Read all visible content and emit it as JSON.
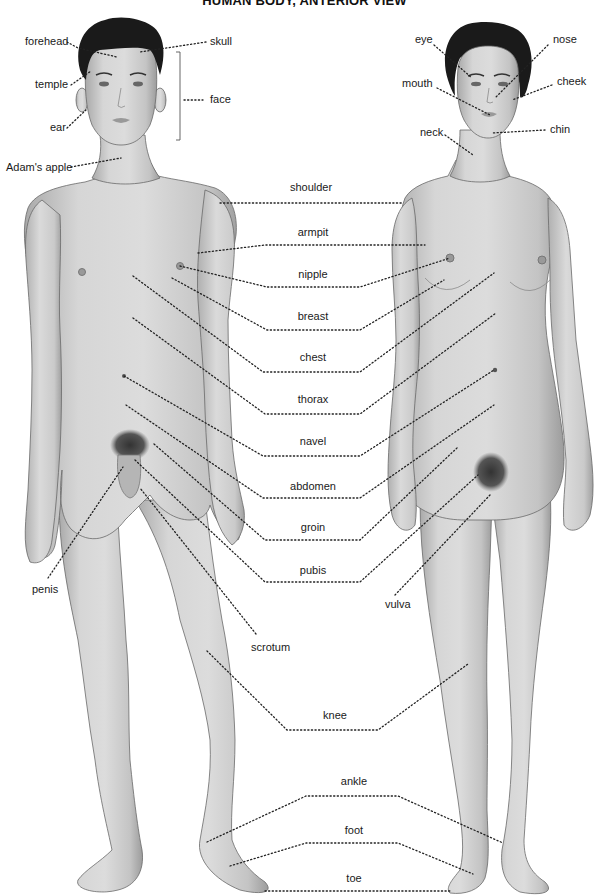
{
  "title": "HUMAN BODY, ANTERIOR VIEW",
  "colors": {
    "background": "#ffffff",
    "skin_light": "#d9d9d9",
    "skin_dark": "#a8a8a8",
    "hair": "#1a1a1a",
    "text": "#1a1a1a",
    "leader_line": "#222222"
  },
  "figures": [
    {
      "id": "male",
      "position": "left"
    },
    {
      "id": "female",
      "position": "right"
    }
  ],
  "labels": {
    "head_male": [
      {
        "id": "forehead",
        "text": "forehead",
        "x": 25,
        "y": 45,
        "anchor": "start"
      },
      {
        "id": "skull",
        "text": "skull",
        "x": 210,
        "y": 45,
        "anchor": "start"
      },
      {
        "id": "temple",
        "text": "temple",
        "x": 35,
        "y": 88,
        "anchor": "start"
      },
      {
        "id": "face",
        "text": "face",
        "x": 210,
        "y": 102,
        "anchor": "start"
      },
      {
        "id": "ear",
        "text": "ear",
        "x": 50,
        "y": 131,
        "anchor": "start"
      },
      {
        "id": "adams-apple",
        "text": "Adam's apple",
        "x": 6,
        "y": 171,
        "anchor": "start"
      }
    ],
    "head_female": [
      {
        "id": "eye",
        "text": "eye",
        "x": 415,
        "y": 43,
        "anchor": "start"
      },
      {
        "id": "nose",
        "text": "nose",
        "x": 553,
        "y": 43,
        "anchor": "start"
      },
      {
        "id": "mouth",
        "text": "mouth",
        "x": 402,
        "y": 87,
        "anchor": "start"
      },
      {
        "id": "cheek",
        "text": "cheek",
        "x": 557,
        "y": 85,
        "anchor": "start"
      },
      {
        "id": "chin",
        "text": "chin",
        "x": 550,
        "y": 132,
        "anchor": "start"
      },
      {
        "id": "neck",
        "text": "neck",
        "x": 420,
        "y": 135,
        "anchor": "start"
      }
    ],
    "center": [
      {
        "id": "shoulder",
        "text": "shoulder",
        "x": 311,
        "y": 191
      },
      {
        "id": "armpit",
        "text": "armpit",
        "x": 313,
        "y": 236
      },
      {
        "id": "nipple",
        "text": "nipple",
        "x": 313,
        "y": 278
      },
      {
        "id": "breast",
        "text": "breast",
        "x": 313,
        "y": 319
      },
      {
        "id": "chest",
        "text": "chest",
        "x": 313,
        "y": 360
      },
      {
        "id": "thorax",
        "text": "thorax",
        "x": 313,
        "y": 402
      },
      {
        "id": "navel",
        "text": "navel",
        "x": 313,
        "y": 444
      },
      {
        "id": "abdomen",
        "text": "abdomen",
        "x": 313,
        "y": 490
      },
      {
        "id": "groin",
        "text": "groin",
        "x": 313,
        "y": 530
      },
      {
        "id": "pubis",
        "text": "pubis",
        "x": 313,
        "y": 573
      },
      {
        "id": "knee",
        "text": "knee",
        "x": 335,
        "y": 719
      },
      {
        "id": "ankle",
        "text": "ankle",
        "x": 354,
        "y": 784
      },
      {
        "id": "foot",
        "text": "foot",
        "x": 354,
        "y": 833
      },
      {
        "id": "toe",
        "text": "toe",
        "x": 354,
        "y": 881
      }
    ],
    "lower": [
      {
        "id": "penis",
        "text": "penis",
        "x": 32,
        "y": 592,
        "anchor": "start"
      },
      {
        "id": "scrotum",
        "text": "scrotum",
        "x": 251,
        "y": 650,
        "anchor": "start"
      },
      {
        "id": "vulva",
        "text": "vulva",
        "x": 385,
        "y": 607,
        "anchor": "start"
      }
    ]
  }
}
